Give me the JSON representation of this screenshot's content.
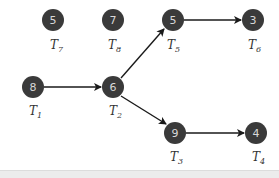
{
  "diagram": {
    "type": "task-dependency-graph",
    "colors": {
      "node_fill": "#3a3a3a",
      "node_text": "#d8d8d8",
      "edge": "#1a1a1a",
      "label": "#333333",
      "background": "#ffffff",
      "bottom_strip": "#ececec"
    },
    "nodes": [
      {
        "id": "T1",
        "label_main": "T",
        "label_sub": "1",
        "weight": "8",
        "x": 33,
        "y": 87
      },
      {
        "id": "T2",
        "label_main": "T",
        "label_sub": "2",
        "weight": "6",
        "x": 113,
        "y": 87
      },
      {
        "id": "T3",
        "label_main": "T",
        "label_sub": "3",
        "weight": "9",
        "x": 175,
        "y": 133
      },
      {
        "id": "T4",
        "label_main": "T",
        "label_sub": "4",
        "weight": "4",
        "x": 256,
        "y": 133
      },
      {
        "id": "T5",
        "label_main": "T",
        "label_sub": "5",
        "weight": "5",
        "x": 173,
        "y": 20
      },
      {
        "id": "T6",
        "label_main": "T",
        "label_sub": "6",
        "weight": "3",
        "x": 253,
        "y": 20
      },
      {
        "id": "T7",
        "label_main": "T",
        "label_sub": "7",
        "weight": "5",
        "x": 53,
        "y": 20
      },
      {
        "id": "T8",
        "label_main": "T",
        "label_sub": "8",
        "weight": "7",
        "x": 113,
        "y": 20
      }
    ],
    "edges": [
      {
        "from": "T1",
        "to": "T2"
      },
      {
        "from": "T2",
        "to": "T5"
      },
      {
        "from": "T2",
        "to": "T3"
      },
      {
        "from": "T5",
        "to": "T6"
      },
      {
        "from": "T3",
        "to": "T4"
      }
    ]
  }
}
